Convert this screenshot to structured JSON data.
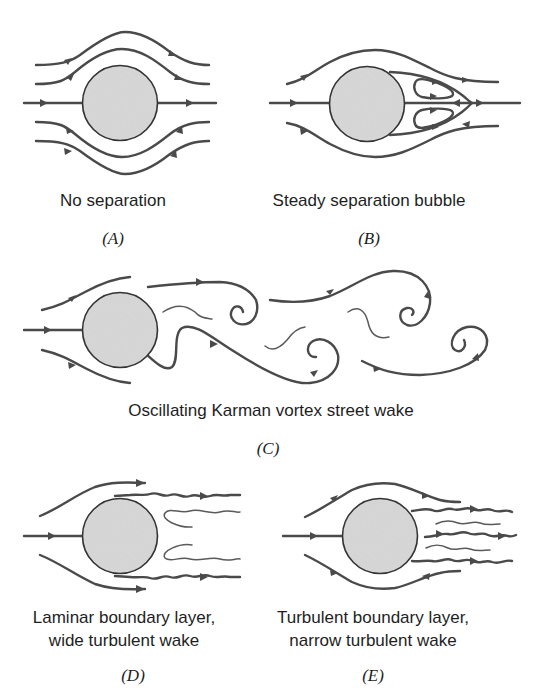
{
  "figure": {
    "panels": [
      {
        "id": "A",
        "id_label": "(A)",
        "caption_lines": [
          "No separation"
        ]
      },
      {
        "id": "B",
        "id_label": "(B)",
        "caption_lines": [
          "Steady separation bubble"
        ]
      },
      {
        "id": "C",
        "id_label": "(C)",
        "caption_lines": [
          "Oscillating Karman vortex street wake"
        ]
      },
      {
        "id": "D",
        "id_label": "(D)",
        "caption_lines": [
          "Laminar boundary layer,",
          "wide turbulent wake"
        ]
      },
      {
        "id": "E",
        "id_label": "(E)",
        "caption_lines": [
          "Turbulent boundary layer,",
          "narrow turbulent wake"
        ]
      }
    ],
    "colors": {
      "background": "#ffffff",
      "streamline": "#4a4a4a",
      "cylinder_fill": "#d6d6d6",
      "cylinder_stroke": "#333333",
      "text": "#1e1e1e"
    }
  }
}
